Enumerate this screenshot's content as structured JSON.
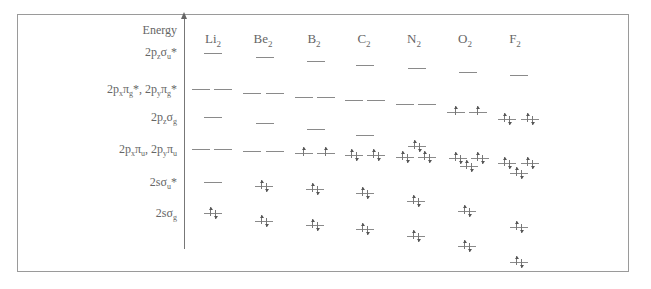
{
  "diagram": {
    "axis_label": "Energy",
    "row_labels": [
      {
        "id": "s2pz_su_star",
        "html": "2p<sub>z</sub>σ<sub>u</sub>*",
        "text": "2pzσu*",
        "y": 45
      },
      {
        "id": "pi_g_star",
        "html": "2p<sub>x</sub>π<sub>g</sub>*, 2p<sub>y</sub>π<sub>g</sub>*",
        "text": "2pxπg*, 2pyπg*",
        "y": 82
      },
      {
        "id": "s2pz_sg",
        "html": "2p<sub>z</sub>σ<sub>g</sub>",
        "text": "2pzσg",
        "y": 110
      },
      {
        "id": "pi_u",
        "html": "2p<sub>x</sub>π<sub>u</sub>, 2p<sub>y</sub>π<sub>u</sub>",
        "text": "2pxπu, 2pyπu",
        "y": 142
      },
      {
        "id": "s2s_su_star",
        "html": "2sσ<sub>u</sub>*",
        "text": "2sσu*",
        "y": 175
      },
      {
        "id": "s2s_sg",
        "html": "2sσ<sub>g</sub>",
        "text": "2sσg",
        "y": 206
      }
    ],
    "molecules": [
      {
        "name": "Li",
        "sub": "2",
        "x": 213
      },
      {
        "name": "Be",
        "sub": "2",
        "x": 263
      },
      {
        "name": "B",
        "sub": "2",
        "x": 314
      },
      {
        "name": "C",
        "sub": "2",
        "x": 364
      },
      {
        "name": "N",
        "sub": "2",
        "x": 414
      },
      {
        "name": "O",
        "sub": "2",
        "x": 465
      },
      {
        "name": "F",
        "sub": "2",
        "x": 515
      }
    ],
    "levels": [
      {
        "mol": "Li2",
        "orbital": "2pz σu*",
        "x": 204,
        "y": 53,
        "e": ""
      },
      {
        "mol": "Li2",
        "orbital": "π*",
        "x": 192,
        "y": 89,
        "e": ""
      },
      {
        "mol": "Li2",
        "orbital": "π*",
        "x": 214,
        "y": 89,
        "e": ""
      },
      {
        "mol": "Li2",
        "orbital": "2pz σg",
        "x": 204,
        "y": 117,
        "e": ""
      },
      {
        "mol": "Li2",
        "orbital": "π",
        "x": 192,
        "y": 149,
        "e": ""
      },
      {
        "mol": "Li2",
        "orbital": "π",
        "x": 214,
        "y": 149,
        "e": ""
      },
      {
        "mol": "Li2",
        "orbital": "2s σu*",
        "x": 204,
        "y": 182,
        "e": ""
      },
      {
        "mol": "Li2",
        "orbital": "2s σg",
        "x": 204,
        "y": 213,
        "e": "ud"
      },
      {
        "mol": "Be2",
        "orbital": "2pz σu*",
        "x": 256,
        "y": 57,
        "e": ""
      },
      {
        "mol": "Be2",
        "orbital": "π*",
        "x": 243,
        "y": 93,
        "e": ""
      },
      {
        "mol": "Be2",
        "orbital": "π*",
        "x": 266,
        "y": 93,
        "e": ""
      },
      {
        "mol": "Be2",
        "orbital": "2pz σg",
        "x": 256,
        "y": 123,
        "e": ""
      },
      {
        "mol": "Be2",
        "orbital": "π",
        "x": 243,
        "y": 151,
        "e": ""
      },
      {
        "mol": "Be2",
        "orbital": "π",
        "x": 266,
        "y": 151,
        "e": ""
      },
      {
        "mol": "Be2",
        "orbital": "2s σu*",
        "x": 255,
        "y": 186,
        "e": "ud"
      },
      {
        "mol": "Be2",
        "orbital": "2s σg",
        "x": 255,
        "y": 221,
        "e": "ud"
      },
      {
        "mol": "B2",
        "orbital": "2pz σu*",
        "x": 307,
        "y": 61,
        "e": ""
      },
      {
        "mol": "B2",
        "orbital": "π*",
        "x": 295,
        "y": 97,
        "e": ""
      },
      {
        "mol": "B2",
        "orbital": "π*",
        "x": 317,
        "y": 97,
        "e": ""
      },
      {
        "mol": "B2",
        "orbital": "2pz σg",
        "x": 307,
        "y": 129,
        "e": ""
      },
      {
        "mol": "B2",
        "orbital": "π",
        "x": 295,
        "y": 153,
        "e": "u"
      },
      {
        "mol": "B2",
        "orbital": "π",
        "x": 317,
        "y": 153,
        "e": "u"
      },
      {
        "mol": "B2",
        "orbital": "2s σu*",
        "x": 306,
        "y": 189,
        "e": "ud"
      },
      {
        "mol": "B2",
        "orbital": "2s σg",
        "x": 306,
        "y": 225,
        "e": "ud"
      },
      {
        "mol": "C2",
        "orbital": "2pz σu*",
        "x": 356,
        "y": 65,
        "e": ""
      },
      {
        "mol": "C2",
        "orbital": "π*",
        "x": 345,
        "y": 100,
        "e": ""
      },
      {
        "mol": "C2",
        "orbital": "π*",
        "x": 367,
        "y": 100,
        "e": ""
      },
      {
        "mol": "C2",
        "orbital": "2pz σg",
        "x": 356,
        "y": 135,
        "e": ""
      },
      {
        "mol": "C2",
        "orbital": "π",
        "x": 345,
        "y": 155,
        "e": "ud"
      },
      {
        "mol": "C2",
        "orbital": "π",
        "x": 367,
        "y": 155,
        "e": "ud"
      },
      {
        "mol": "C2",
        "orbital": "2s σu*",
        "x": 356,
        "y": 193,
        "e": "ud"
      },
      {
        "mol": "C2",
        "orbital": "2s σg",
        "x": 356,
        "y": 229,
        "e": "ud"
      },
      {
        "mol": "N2",
        "orbital": "2pz σu*",
        "x": 408,
        "y": 68,
        "e": ""
      },
      {
        "mol": "N2",
        "orbital": "π*",
        "x": 396,
        "y": 104,
        "e": ""
      },
      {
        "mol": "N2",
        "orbital": "π*",
        "x": 418,
        "y": 104,
        "e": ""
      },
      {
        "mol": "N2",
        "orbital": "2pz σg",
        "x": 408,
        "y": 146,
        "e": "ud"
      },
      {
        "mol": "N2",
        "orbital": "π",
        "x": 396,
        "y": 157,
        "e": "ud"
      },
      {
        "mol": "N2",
        "orbital": "π",
        "x": 418,
        "y": 157,
        "e": "ud"
      },
      {
        "mol": "N2",
        "orbital": "2s σu*",
        "x": 407,
        "y": 201,
        "e": "ud"
      },
      {
        "mol": "N2",
        "orbital": "2s σg",
        "x": 407,
        "y": 236,
        "e": "ud"
      },
      {
        "mol": "O2",
        "orbital": "2pz σu*",
        "x": 459,
        "y": 72,
        "e": ""
      },
      {
        "mol": "O2",
        "orbital": "π*",
        "x": 447,
        "y": 112,
        "e": "u"
      },
      {
        "mol": "O2",
        "orbital": "π*",
        "x": 469,
        "y": 112,
        "e": "u"
      },
      {
        "mol": "O2",
        "orbital": "π",
        "x": 449,
        "y": 158,
        "e": "ud"
      },
      {
        "mol": "O2",
        "orbital": "π",
        "x": 471,
        "y": 158,
        "e": "ud"
      },
      {
        "mol": "O2",
        "orbital": "2pz σg",
        "x": 460,
        "y": 166,
        "e": "ud"
      },
      {
        "mol": "O2",
        "orbital": "2s σu*",
        "x": 458,
        "y": 211,
        "e": "ud"
      },
      {
        "mol": "O2",
        "orbital": "2s σg",
        "x": 458,
        "y": 246,
        "e": "ud"
      },
      {
        "mol": "F2",
        "orbital": "2pz σu*",
        "x": 510,
        "y": 75,
        "e": ""
      },
      {
        "mol": "F2",
        "orbital": "π*",
        "x": 498,
        "y": 119,
        "e": "ud"
      },
      {
        "mol": "F2",
        "orbital": "π*",
        "x": 521,
        "y": 119,
        "e": "ud"
      },
      {
        "mol": "F2",
        "orbital": "π",
        "x": 498,
        "y": 163,
        "e": "ud"
      },
      {
        "mol": "F2",
        "orbital": "π",
        "x": 521,
        "y": 163,
        "e": "ud"
      },
      {
        "mol": "F2",
        "orbital": "2pz σg",
        "x": 510,
        "y": 173,
        "e": "ud"
      },
      {
        "mol": "F2",
        "orbital": "2s σu*",
        "x": 510,
        "y": 227,
        "e": "ud"
      },
      {
        "mol": "F2",
        "orbital": "2s σg",
        "x": 510,
        "y": 262,
        "e": "ud"
      }
    ]
  }
}
